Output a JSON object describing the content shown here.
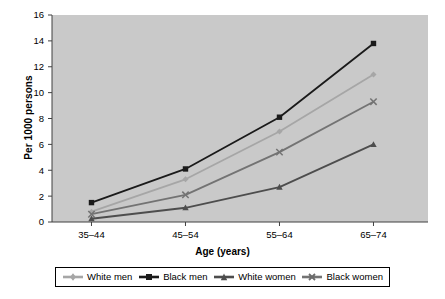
{
  "chart_data": {
    "type": "line",
    "title": "",
    "xlabel": "Age (years)",
    "ylabel": "Per 1000 persons",
    "categories": [
      "35–44",
      "45–54",
      "55–64",
      "65–74"
    ],
    "ylim": [
      0,
      16
    ],
    "yticks": [
      0,
      2,
      4,
      6,
      8,
      10,
      12,
      14,
      16
    ],
    "ytick_labels": [
      "0",
      "2",
      "4",
      "6",
      "8",
      "10",
      "12",
      "14",
      "16"
    ],
    "grid": false,
    "legend_position": "bottom",
    "plot_background": "#c9c9c9",
    "series": [
      {
        "name": "White men",
        "marker": "diamond",
        "color": "#a6a6a6",
        "values": [
          0.8,
          3.3,
          7.0,
          11.4
        ]
      },
      {
        "name": "Black men",
        "marker": "square",
        "color": "#1a1a1a",
        "values": [
          1.5,
          4.1,
          8.1,
          13.8
        ]
      },
      {
        "name": "White women",
        "marker": "triangle",
        "color": "#4d4d4d",
        "values": [
          0.25,
          1.1,
          2.7,
          6.0
        ]
      },
      {
        "name": "Black women",
        "marker": "cross",
        "color": "#737373",
        "values": [
          0.6,
          2.1,
          5.4,
          9.3
        ]
      }
    ]
  },
  "axis": {
    "y_title": "Per 1000 persons",
    "x_title": "Age (years)",
    "ytick_0": "0",
    "ytick_1": "2",
    "ytick_2": "4",
    "ytick_3": "6",
    "ytick_4": "8",
    "ytick_5": "10",
    "ytick_6": "12",
    "ytick_7": "14",
    "ytick_8": "16",
    "xtick_0": "35–44",
    "xtick_1": "45–54",
    "xtick_2": "55–64",
    "xtick_3": "65–74"
  },
  "legend": {
    "items": [
      {
        "label": "White men"
      },
      {
        "label": "Black men"
      },
      {
        "label": "White women"
      },
      {
        "label": "Black women"
      }
    ]
  }
}
